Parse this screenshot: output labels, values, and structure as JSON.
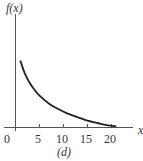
{
  "chart_data": {
    "type": "line",
    "title": "",
    "caption": "(d)",
    "xlabel": "x",
    "ylabel": "f(x)",
    "x_ticks": [
      0,
      5,
      10,
      15,
      20
    ],
    "x_tick_labels": [
      "0",
      "5",
      "10",
      "15",
      "20"
    ],
    "xlim": [
      0,
      24
    ],
    "y_ticks": [],
    "grid": false,
    "legend": null,
    "series": [
      {
        "name": "f(x)",
        "description": "decreasing convex curve, relative height (axis = 0, top of y-axis = 1)",
        "x": [
          1,
          2,
          3,
          4,
          5,
          7,
          9,
          11,
          13,
          15,
          17,
          19,
          21
        ],
        "y": [
          0.59,
          0.47,
          0.39,
          0.33,
          0.28,
          0.21,
          0.16,
          0.12,
          0.09,
          0.06,
          0.04,
          0.02,
          0.01
        ]
      }
    ],
    "color": "#222222"
  },
  "labels": {
    "ylabel": "f(x)",
    "xlabel": "x",
    "caption": "(d)",
    "ticks": [
      "0",
      "5",
      "10",
      "15",
      "20"
    ]
  }
}
